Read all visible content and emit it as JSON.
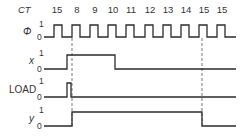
{
  "diagram": {
    "type": "timing-diagram",
    "counter_label": "CT",
    "counter_values": [
      "15",
      "8",
      "9",
      "10",
      "11",
      "12",
      "13",
      "14",
      "15",
      "15"
    ],
    "counter_x": [
      57,
      77,
      95,
      113,
      131,
      150,
      168,
      186,
      204,
      222
    ],
    "signals": [
      {
        "name": "Φ",
        "high_label": "1",
        "low_label": "0",
        "y_high": 25,
        "y_low": 37,
        "waveform": "54,37 54,25 62,25 62,37 72,37 72,25 80,25 80,37 90,37 90,25 98,25 98,37 108,37 108,25 116,25 116,37 126,37 126,25 134,25 134,37 145,37 145,25 153,25 153,37 163,37 163,25 171,25 171,37 181,37 181,25 189,25 189,37 199,37 199,25 207,25 207,37 217,37 217,25 225,25 225,37 236,37",
        "start_x": 44
      },
      {
        "name": "x",
        "high_label": "1",
        "low_label": "0",
        "y_high": 55,
        "y_low": 69,
        "waveform": "44,69 67,69 67,55 115,55 115,69 236,69"
      },
      {
        "name": "LOAD",
        "high_label": "1",
        "low_label": "0",
        "y_high": 83,
        "y_low": 97,
        "waveform": "44,97 67,97 67,83 71,83 71,97 236,97"
      },
      {
        "name": "y",
        "high_label": "1",
        "low_label": "0",
        "y_high": 112,
        "y_low": 126,
        "waveform": "44,126 72,126 72,112 202,112 202,126 236,126"
      }
    ],
    "dashed_markers_x": [
      72,
      202
    ]
  }
}
